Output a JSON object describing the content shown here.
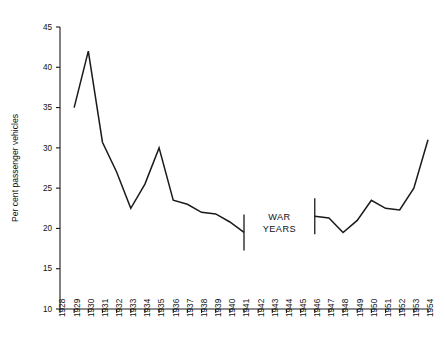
{
  "chart_data": {
    "type": "line",
    "title": "",
    "subtitle": "",
    "xlabel": "",
    "ylabel": "Per cent passenger vehicles",
    "xlim": [
      1928,
      1954
    ],
    "ylim": [
      10,
      45
    ],
    "grid": false,
    "legend": "none",
    "y_ticks": [
      10,
      15,
      20,
      25,
      30,
      35,
      40,
      45
    ],
    "y_tick_labels": [
      "10",
      "15",
      "20",
      "25",
      "30",
      "35",
      "40",
      "45"
    ],
    "x_ticks": [
      1928,
      1929,
      1930,
      1931,
      1932,
      1933,
      1934,
      1935,
      1936,
      1937,
      1938,
      1939,
      1940,
      1941,
      1942,
      1943,
      1944,
      1945,
      1946,
      1947,
      1948,
      1949,
      1950,
      1951,
      1952,
      1953,
      1954
    ],
    "x_tick_labels": [
      "1928",
      "1929",
      "1930",
      "1931",
      "1932",
      "1933",
      "1934",
      "1935",
      "1936",
      "1937",
      "1938",
      "1939",
      "1940",
      "1941",
      "1942",
      "1943",
      "1944",
      "1945",
      "1946",
      "1947",
      "1948",
      "1949",
      "1950",
      "1951",
      "1952",
      "1953",
      "1954"
    ],
    "series": [
      {
        "name": "Per cent passenger vehicles (pre-war)",
        "x": [
          1929,
          1930,
          1931,
          1932,
          1933,
          1934,
          1935,
          1936,
          1937,
          1938,
          1939,
          1940,
          1941
        ],
        "values": [
          35.0,
          42.0,
          30.7,
          27.0,
          22.5,
          25.5,
          30.0,
          23.5,
          23.0,
          22.0,
          21.8,
          20.8,
          19.5
        ]
      },
      {
        "name": "Per cent passenger vehicles (post-war)",
        "x": [
          1946,
          1947,
          1948,
          1949,
          1950,
          1951,
          1952,
          1953,
          1954
        ],
        "values": [
          21.5,
          21.3,
          19.5,
          21.0,
          23.5,
          22.5,
          22.3,
          25.0,
          31.0
        ]
      }
    ],
    "gap": {
      "from": 1941,
      "to": 1946,
      "annotation_line_1": "WAR",
      "annotation_line_2": "YEARS"
    },
    "colors": {
      "line": "#1a1a1a",
      "axis": "#1a1a1a",
      "background": "#ffffff",
      "text": "#111111"
    }
  }
}
